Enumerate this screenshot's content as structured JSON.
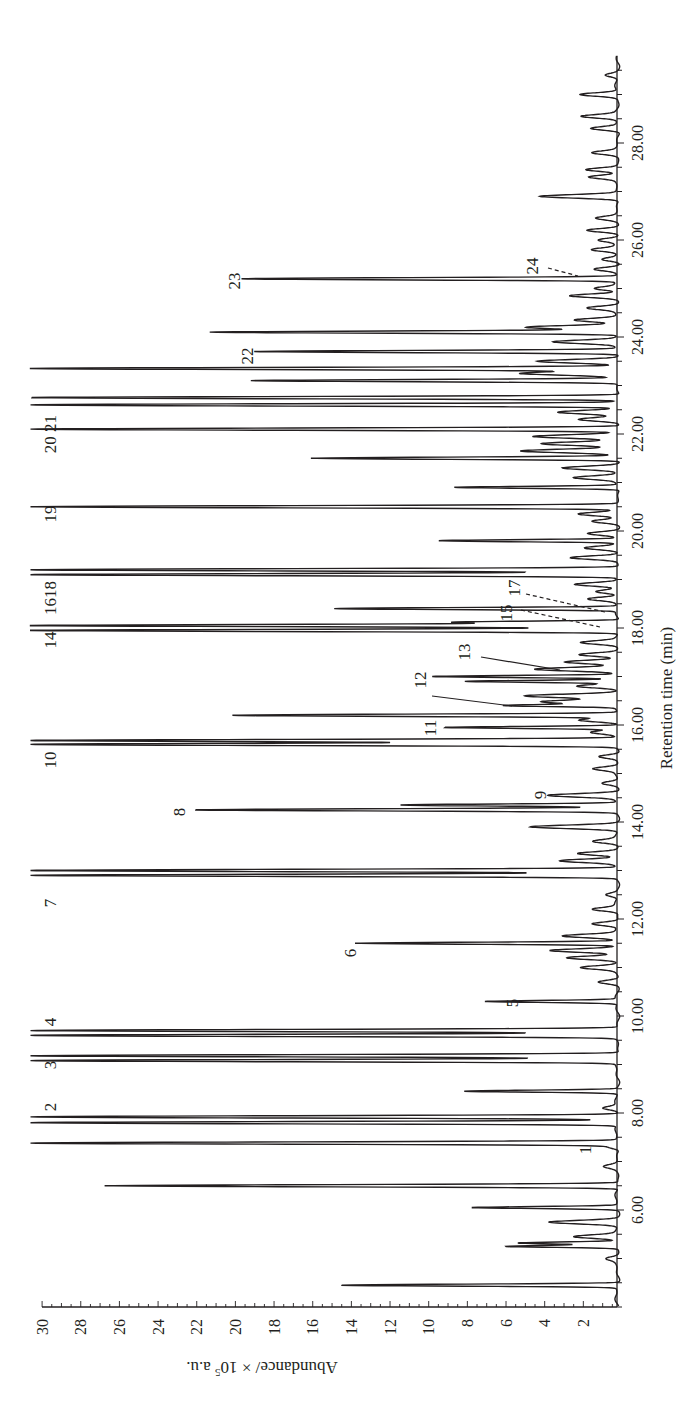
{
  "chart_data": {
    "type": "line",
    "orientation": "rotated-90-clockwise",
    "title": "",
    "xlabel": "Retention time (min)",
    "ylabel": "Abundance/ × 10^5 a.u.",
    "ylabel_parts": {
      "prefix": "Abundance/ × 10",
      "sup": "5",
      "suffix": " a.u."
    },
    "xlim": [
      4.0,
      29.8
    ],
    "ylim": [
      0,
      30
    ],
    "x_ticks": [
      "6.00",
      "8.00",
      "10.00",
      "12.00",
      "14.00",
      "16.00",
      "18.00",
      "20.00",
      "22.00",
      "24.00",
      "26.00",
      "28.00"
    ],
    "x_tick_values": [
      6,
      8,
      10,
      12,
      14,
      16,
      18,
      20,
      22,
      24,
      26,
      28
    ],
    "y_ticks": [
      "2",
      "4",
      "6",
      "8",
      "10",
      "12",
      "14",
      "16",
      "18",
      "20",
      "22",
      "24",
      "26",
      "28",
      "30"
    ],
    "y_tick_values": [
      2,
      4,
      6,
      8,
      10,
      12,
      14,
      16,
      18,
      20,
      22,
      24,
      26,
      28,
      30
    ],
    "grid": false,
    "legend": null,
    "peaks": [
      {
        "t": 4.45,
        "h": 14.3
      },
      {
        "t": 5.0,
        "h": 0.5
      },
      {
        "t": 5.25,
        "h": 5.8
      },
      {
        "t": 5.32,
        "h": 5.2
      },
      {
        "t": 5.45,
        "h": 2.2
      },
      {
        "t": 5.75,
        "h": 3.5
      },
      {
        "t": 6.05,
        "h": 7.5
      },
      {
        "t": 6.5,
        "h": 26.6
      },
      {
        "t": 6.9,
        "h": 0.6
      },
      {
        "t": 7.3,
        "h": 0.6,
        "label": "1"
      },
      {
        "t": 7.38,
        "h": 30.5
      },
      {
        "t": 7.8,
        "h": 30.5,
        "label": "2"
      },
      {
        "t": 7.92,
        "h": 30.5
      },
      {
        "t": 8.1,
        "h": 0.8
      },
      {
        "t": 8.45,
        "h": 7.9
      },
      {
        "t": 9.08,
        "h": 30.5,
        "label": "3"
      },
      {
        "t": 9.18,
        "h": 30.5
      },
      {
        "t": 9.6,
        "h": 30.5,
        "label": "4"
      },
      {
        "t": 9.7,
        "h": 30.5
      },
      {
        "t": 10.3,
        "h": 6.8,
        "label": "5"
      },
      {
        "t": 10.7,
        "h": 1.0
      },
      {
        "t": 11.0,
        "h": 1.8
      },
      {
        "t": 11.2,
        "h": 2.6
      },
      {
        "t": 11.35,
        "h": 3.6
      },
      {
        "t": 11.5,
        "h": 13.5,
        "label": "6"
      },
      {
        "t": 11.65,
        "h": 2.8
      },
      {
        "t": 11.9,
        "h": 1.4
      },
      {
        "t": 12.2,
        "h": 1.3
      },
      {
        "t": 12.5,
        "h": 0.6
      },
      {
        "t": 12.9,
        "h": 30.5,
        "label": "7"
      },
      {
        "t": 13.0,
        "h": 30.5
      },
      {
        "t": 13.2,
        "h": 3.0
      },
      {
        "t": 13.35,
        "h": 2.1
      },
      {
        "t": 13.6,
        "h": 1.2
      },
      {
        "t": 13.9,
        "h": 4.5
      },
      {
        "t": 14.25,
        "h": 21.8,
        "label": "8"
      },
      {
        "t": 14.35,
        "h": 11.2
      },
      {
        "t": 14.55,
        "h": 3.6,
        "label": "9"
      },
      {
        "t": 14.8,
        "h": 0.8
      },
      {
        "t": 15.1,
        "h": 1.2
      },
      {
        "t": 15.35,
        "h": 1.0
      },
      {
        "t": 15.6,
        "h": 30.5,
        "label": "10"
      },
      {
        "t": 15.68,
        "h": 30.5
      },
      {
        "t": 15.85,
        "h": 1.3
      },
      {
        "t": 15.95,
        "h": 9.0,
        "label": "11"
      },
      {
        "t": 16.1,
        "h": 2.0
      },
      {
        "t": 16.2,
        "h": 19.9
      },
      {
        "t": 16.4,
        "h": 5.5,
        "label": "12"
      },
      {
        "t": 16.48,
        "h": 3.9
      },
      {
        "t": 16.6,
        "h": 4.8
      },
      {
        "t": 16.8,
        "h": 2.2
      },
      {
        "t": 16.9,
        "h": 7.8
      },
      {
        "t": 17.0,
        "h": 9.5,
        "label": "13"
      },
      {
        "t": 17.15,
        "h": 4.2
      },
      {
        "t": 17.3,
        "h": 2.8
      },
      {
        "t": 17.45,
        "h": 2.0,
        "label": "15"
      },
      {
        "t": 17.7,
        "h": 1.8
      },
      {
        "t": 17.95,
        "h": 30.5,
        "label": "14"
      },
      {
        "t": 18.05,
        "h": 30.5,
        "label": "16"
      },
      {
        "t": 18.12,
        "h": 8.5
      },
      {
        "t": 18.4,
        "h": 14.6
      },
      {
        "t": 18.6,
        "h": 1.5
      },
      {
        "t": 18.75,
        "h": 1.2,
        "label": "17"
      },
      {
        "t": 18.9,
        "h": 2.2
      },
      {
        "t": 19.1,
        "h": 30.5,
        "label": "18"
      },
      {
        "t": 19.2,
        "h": 30.5
      },
      {
        "t": 19.45,
        "h": 2.5
      },
      {
        "t": 19.65,
        "h": 1.6
      },
      {
        "t": 19.8,
        "h": 9.2
      },
      {
        "t": 19.95,
        "h": 1.5
      },
      {
        "t": 20.2,
        "h": 1.3
      },
      {
        "t": 20.35,
        "h": 2.0
      },
      {
        "t": 20.5,
        "h": 30.5,
        "label": "19"
      },
      {
        "t": 20.9,
        "h": 8.5
      },
      {
        "t": 21.1,
        "h": 2.2
      },
      {
        "t": 21.3,
        "h": 2.8
      },
      {
        "t": 21.5,
        "h": 15.9
      },
      {
        "t": 21.65,
        "h": 5.0
      },
      {
        "t": 21.8,
        "h": 3.8
      },
      {
        "t": 21.95,
        "h": 4.4
      },
      {
        "t": 22.1,
        "h": 30.5,
        "label": "20"
      },
      {
        "t": 22.3,
        "h": 2.0
      },
      {
        "t": 22.45,
        "h": 3.0
      },
      {
        "t": 22.6,
        "h": 30.5,
        "label": "21"
      },
      {
        "t": 22.75,
        "h": 30.5
      },
      {
        "t": 23.1,
        "h": 18.9
      },
      {
        "t": 23.25,
        "h": 5.0
      },
      {
        "t": 23.35,
        "h": 30.5
      },
      {
        "t": 23.5,
        "h": 4.2
      },
      {
        "t": 23.7,
        "h": 18.7,
        "label": "22"
      },
      {
        "t": 23.9,
        "h": 3.3
      },
      {
        "t": 24.1,
        "h": 21.1
      },
      {
        "t": 24.2,
        "h": 4.8
      },
      {
        "t": 24.35,
        "h": 2.2
      },
      {
        "t": 24.6,
        "h": 1.5
      },
      {
        "t": 24.85,
        "h": 2.5
      },
      {
        "t": 25.0,
        "h": 1.2
      },
      {
        "t": 25.2,
        "h": 19.4,
        "label": "23"
      },
      {
        "t": 25.4,
        "h": 1.2,
        "label": "24"
      },
      {
        "t": 25.6,
        "h": 0.8
      },
      {
        "t": 25.8,
        "h": 1.3
      },
      {
        "t": 26.0,
        "h": 1.0
      },
      {
        "t": 26.2,
        "h": 1.6
      },
      {
        "t": 26.45,
        "h": 1.0
      },
      {
        "t": 26.9,
        "h": 4.1
      },
      {
        "t": 27.3,
        "h": 1.4
      },
      {
        "t": 27.45,
        "h": 1.7
      },
      {
        "t": 27.8,
        "h": 1.2
      },
      {
        "t": 28.3,
        "h": 1.4
      },
      {
        "t": 28.55,
        "h": 1.8
      },
      {
        "t": 29.0,
        "h": 2.0
      },
      {
        "t": 29.4,
        "h": 0.6
      }
    ],
    "annotations": [
      {
        "label": "1",
        "t": 7.3,
        "style": "text"
      },
      {
        "label": "2",
        "t": 7.8,
        "style": "text"
      },
      {
        "label": "3",
        "t": 9.1,
        "style": "text"
      },
      {
        "label": "4",
        "t": 9.65,
        "style": "text"
      },
      {
        "label": "5",
        "t": 10.3,
        "style": "text"
      },
      {
        "label": "6",
        "t": 11.5,
        "style": "text"
      },
      {
        "label": "7",
        "t": 12.9,
        "style": "text"
      },
      {
        "label": "8",
        "t": 14.25,
        "style": "text"
      },
      {
        "label": "9",
        "t": 14.55,
        "style": "text"
      },
      {
        "label": "10",
        "t": 15.6,
        "style": "text"
      },
      {
        "label": "11",
        "t": 15.95,
        "style": "text"
      },
      {
        "label": "12",
        "t": 16.4,
        "style": "solid-leader"
      },
      {
        "label": "13",
        "t": 17.0,
        "style": "solid-leader"
      },
      {
        "label": "14",
        "t": 17.95,
        "style": "text"
      },
      {
        "label": "15",
        "t": 17.45,
        "style": "dashed-leader"
      },
      {
        "label": "16",
        "t": 18.05,
        "style": "text"
      },
      {
        "label": "17",
        "t": 18.75,
        "style": "dashed-leader"
      },
      {
        "label": "18",
        "t": 19.1,
        "style": "text"
      },
      {
        "label": "19",
        "t": 20.5,
        "style": "text"
      },
      {
        "label": "20",
        "t": 22.1,
        "style": "text"
      },
      {
        "label": "21",
        "t": 22.6,
        "style": "text"
      },
      {
        "label": "22",
        "t": 23.7,
        "style": "text"
      },
      {
        "label": "23",
        "t": 25.2,
        "style": "text"
      },
      {
        "label": "24",
        "t": 25.4,
        "style": "dashed-leader"
      }
    ],
    "line_color": "#231f20",
    "background": "#ffffff"
  },
  "labels": {
    "peak_1": "1",
    "peak_2": "2",
    "peak_3": "3",
    "peak_4": "4",
    "peak_5": "5",
    "peak_6": "6",
    "peak_7": "7",
    "peak_8": "8",
    "peak_9": "9",
    "peak_10": "10",
    "peak_11": "11",
    "peak_12": "12",
    "peak_13": "13",
    "peak_14": "14",
    "peak_15": "15",
    "peak_1618": "1618",
    "peak_17": "17",
    "peak_19": "19",
    "peak_2021": "20 21",
    "peak_22": "22",
    "peak_23": "23",
    "peak_24": "24"
  }
}
